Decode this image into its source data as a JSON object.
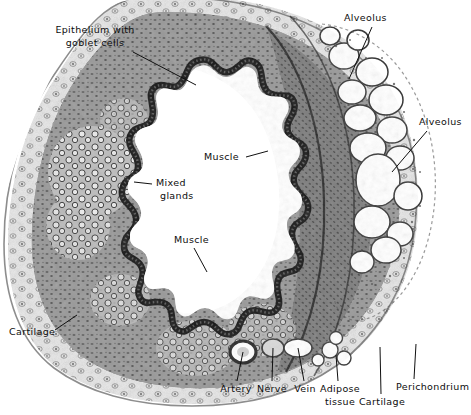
{
  "figure": {
    "type": "labeled-micrograph-illustration",
    "width": 471,
    "height": 415,
    "background_color": "#ffffff",
    "ink_color": "#0d0d0d",
    "tissue_tone": "grayscale stipple"
  },
  "labels": [
    {
      "id": "epithelium",
      "text_lines": [
        "Epithelium with",
        "goblet cells"
      ],
      "text": "Epithelium with goblet cells",
      "x": 42,
      "y": 26,
      "align": "center",
      "leader": {
        "x1": 133,
        "y1": 52,
        "x2": 196,
        "y2": 85
      }
    },
    {
      "id": "alveolus-top",
      "text_lines": [
        "Alveolus"
      ],
      "text": "Alveolus",
      "x": 344,
      "y": 13,
      "align": "left",
      "leader": {
        "x1": 372,
        "y1": 27,
        "x2": 349,
        "y2": 79
      }
    },
    {
      "id": "alveolus-right",
      "text_lines": [
        "Alveolus"
      ],
      "text": "Alveolus",
      "x": 419,
      "y": 117,
      "align": "left",
      "leader": {
        "x1": 427,
        "y1": 131,
        "x2": 392,
        "y2": 172
      }
    },
    {
      "id": "muscle-upper",
      "text_lines": [
        "Muscle"
      ],
      "text": "Muscle",
      "x": 205,
      "y": 152,
      "align": "left",
      "leader": {
        "x1": 246,
        "y1": 157,
        "x2": 268,
        "y2": 151
      }
    },
    {
      "id": "mixed-glands",
      "text_lines": [
        "Mixed",
        "glands"
      ],
      "text": "Mixed glands",
      "x": 155,
      "y": 178,
      "align": "left",
      "leader": {
        "x1": 152,
        "y1": 184,
        "x2": 134,
        "y2": 182
      }
    },
    {
      "id": "muscle-lower",
      "text_lines": [
        "Muscle"
      ],
      "text": "Muscle",
      "x": 175,
      "y": 235,
      "align": "left",
      "leader": {
        "x1": 194,
        "y1": 248,
        "x2": 207,
        "y2": 272
      }
    },
    {
      "id": "muscle-right-mid",
      "text_lines": [
        "Muscle"
      ],
      "text": "Muscle",
      "x": 247,
      "y": 240,
      "align": "left",
      "leader": {
        "x1": 252,
        "y1": 245,
        "x2": 240,
        "y2": 255
      }
    },
    {
      "id": "cartilage-left",
      "text_lines": [
        "Cartilage"
      ],
      "text": "Cartilage",
      "x": 9,
      "y": 327,
      "align": "left",
      "leader": {
        "x1": 55,
        "y1": 330,
        "x2": 77,
        "y2": 315
      }
    },
    {
      "id": "artery",
      "text_lines": [
        "Artery"
      ],
      "text": "Artery",
      "x": 219,
      "y": 385,
      "align": "center",
      "leader": {
        "x1": 237,
        "y1": 383,
        "x2": 243,
        "y2": 352
      }
    },
    {
      "id": "nerve",
      "text_lines": [
        "Nerve"
      ],
      "text": "Nerve",
      "x": 255,
      "y": 385,
      "align": "center",
      "leader": {
        "x1": 272,
        "y1": 383,
        "x2": 273,
        "y2": 348
      }
    },
    {
      "id": "vein",
      "text_lines": [
        "Vein"
      ],
      "text": "Vein",
      "x": 292,
      "y": 385,
      "align": "center",
      "leader": {
        "x1": 304,
        "y1": 383,
        "x2": 298,
        "y2": 348
      }
    },
    {
      "id": "adipose-tissue",
      "text_lines": [
        "Adipose",
        "tissue"
      ],
      "text": "Adipose tissue",
      "x": 320,
      "y": 385,
      "align": "center",
      "leader": {
        "x1": 338,
        "y1": 383,
        "x2": 336,
        "y2": 355
      }
    },
    {
      "id": "cartilage-bottom",
      "text_lines": [
        "Cartilage"
      ],
      "text": "Cartilage",
      "x": 363,
      "y": 398,
      "align": "center",
      "leader": {
        "x1": 381,
        "y1": 396,
        "x2": 380,
        "y2": 347
      }
    },
    {
      "id": "perichondrium",
      "text_lines": [
        "Perichondrium"
      ],
      "text": "Perichondrium",
      "x": 396,
      "y": 383,
      "align": "left",
      "leader": {
        "x1": 414,
        "y1": 381,
        "x2": 416,
        "y2": 344
      }
    }
  ]
}
